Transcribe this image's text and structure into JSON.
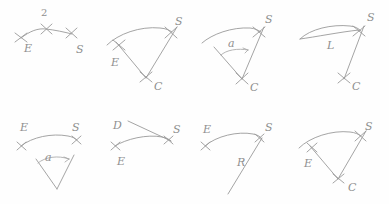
{
  "document": {
    "title": "Hand-drawn arc construction sketches",
    "description": "Eight pencil sketches of circular arc definition methods with cross marks and italic letter labels",
    "stroke_color": "#9a9a9a",
    "label_color": "#8f8f8f",
    "background_color": "#fefefe",
    "canvas": {
      "width": 389,
      "height": 204
    },
    "grid": {
      "rows": 2,
      "cols": 4
    }
  },
  "panels": [
    {
      "id": "panel-1",
      "name": "arc-three-points",
      "row": 1,
      "col": 1,
      "labels": [
        {
          "key": "mid",
          "text": "2",
          "x": 41,
          "y": 8,
          "italic": false
        },
        {
          "key": "start",
          "text": "E",
          "x": 24,
          "y": 43,
          "italic": true
        },
        {
          "key": "end",
          "text": "S",
          "x": 76,
          "y": 44,
          "italic": true
        }
      ],
      "marks": [
        {
          "key": "mark-e",
          "x": 21,
          "y": 38
        },
        {
          "key": "mark-2",
          "x": 46,
          "y": 29
        },
        {
          "key": "mark-s",
          "x": 71,
          "y": 33
        }
      ]
    },
    {
      "id": "panel-2",
      "name": "arc-start-end-center",
      "row": 1,
      "col": 2,
      "labels": [
        {
          "key": "end",
          "text": "S",
          "x": 175,
          "y": 16,
          "italic": true
        },
        {
          "key": "start",
          "text": "E",
          "x": 111,
          "y": 57,
          "italic": true
        },
        {
          "key": "center",
          "text": "C",
          "x": 154,
          "y": 81,
          "italic": true
        }
      ],
      "marks": [
        {
          "key": "mark-s",
          "x": 171,
          "y": 32
        },
        {
          "key": "mark-e",
          "x": 119,
          "y": 45
        },
        {
          "key": "mark-c",
          "x": 146,
          "y": 77
        }
      ]
    },
    {
      "id": "panel-3",
      "name": "arc-center-angle",
      "row": 1,
      "col": 3,
      "labels": [
        {
          "key": "end",
          "text": "S",
          "x": 265,
          "y": 14,
          "italic": true
        },
        {
          "key": "angle",
          "text": "a",
          "x": 228,
          "y": 38,
          "italic": true
        },
        {
          "key": "center",
          "text": "C",
          "x": 250,
          "y": 82,
          "italic": true
        }
      ],
      "marks": [
        {
          "key": "mark-s",
          "x": 259,
          "y": 32
        },
        {
          "key": "mark-c",
          "x": 242,
          "y": 79
        }
      ]
    },
    {
      "id": "panel-4",
      "name": "arc-chord-length",
      "row": 1,
      "col": 4,
      "labels": [
        {
          "key": "end",
          "text": "S",
          "x": 367,
          "y": 12,
          "italic": true
        },
        {
          "key": "length",
          "text": "L",
          "x": 327,
          "y": 40,
          "italic": true
        },
        {
          "key": "center",
          "text": "C",
          "x": 352,
          "y": 81,
          "italic": true
        }
      ],
      "marks": [
        {
          "key": "mark-s",
          "x": 359,
          "y": 31
        },
        {
          "key": "mark-c",
          "x": 344,
          "y": 78
        }
      ]
    },
    {
      "id": "panel-5",
      "name": "arc-endpoints-angle",
      "row": 2,
      "col": 1,
      "labels": [
        {
          "key": "start",
          "text": "E",
          "x": 20,
          "y": 122,
          "italic": true
        },
        {
          "key": "end",
          "text": "S",
          "x": 72,
          "y": 122,
          "italic": true
        },
        {
          "key": "angle",
          "text": "a",
          "x": 45,
          "y": 152,
          "italic": true
        }
      ],
      "marks": [
        {
          "key": "mark-e",
          "x": 21,
          "y": 145
        },
        {
          "key": "mark-s",
          "x": 76,
          "y": 141
        }
      ]
    },
    {
      "id": "panel-6",
      "name": "arc-direction-end",
      "row": 2,
      "col": 2,
      "labels": [
        {
          "key": "direction",
          "text": "D",
          "x": 113,
          "y": 120,
          "italic": true
        },
        {
          "key": "end",
          "text": "S",
          "x": 173,
          "y": 124,
          "italic": true
        },
        {
          "key": "start",
          "text": "E",
          "x": 117,
          "y": 156,
          "italic": true
        }
      ],
      "marks": [
        {
          "key": "mark-e",
          "x": 115,
          "y": 145
        },
        {
          "key": "mark-s",
          "x": 168,
          "y": 140
        }
      ]
    },
    {
      "id": "panel-7",
      "name": "arc-radius",
      "row": 2,
      "col": 3,
      "labels": [
        {
          "key": "start",
          "text": "E",
          "x": 203,
          "y": 124,
          "italic": true
        },
        {
          "key": "end",
          "text": "S",
          "x": 265,
          "y": 122,
          "italic": true
        },
        {
          "key": "radius",
          "text": "R",
          "x": 237,
          "y": 157,
          "italic": true
        }
      ],
      "marks": [
        {
          "key": "mark-e",
          "x": 205,
          "y": 145
        },
        {
          "key": "mark-s",
          "x": 259,
          "y": 139
        }
      ]
    },
    {
      "id": "panel-8",
      "name": "arc-start-end-center-alt",
      "row": 2,
      "col": 4,
      "labels": [
        {
          "key": "end",
          "text": "S",
          "x": 365,
          "y": 121,
          "italic": true
        },
        {
          "key": "start",
          "text": "E",
          "x": 304,
          "y": 158,
          "italic": true
        },
        {
          "key": "center",
          "text": "C",
          "x": 348,
          "y": 182,
          "italic": true
        }
      ],
      "marks": [
        {
          "key": "mark-s",
          "x": 358,
          "y": 137
        },
        {
          "key": "mark-e",
          "x": 312,
          "y": 148
        },
        {
          "key": "mark-c",
          "x": 338,
          "y": 178
        }
      ]
    }
  ]
}
